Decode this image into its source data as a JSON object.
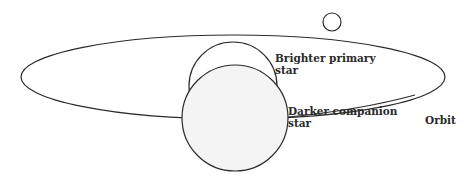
{
  "diagram": {
    "colors": {
      "stroke": "#2b2b2b",
      "star_fill": "#f4f4f4",
      "background": "#ffffff"
    },
    "labels": {
      "primary_line1": "Brighter primary",
      "primary_line2": "star",
      "companion_line1": "Darker companion",
      "companion_line2": "star",
      "orbit": "Orbit"
    },
    "shapes": {
      "orbit_ellipse": {
        "cx": 233,
        "cy": 77,
        "rx": 212,
        "ry": 42
      },
      "primary_star": {
        "cx": 233,
        "cy": 86,
        "r": 44
      },
      "companion_star": {
        "cx": 235,
        "cy": 118,
        "r": 53
      },
      "small_star": {
        "cx": 332,
        "cy": 22,
        "r": 9
      }
    }
  }
}
